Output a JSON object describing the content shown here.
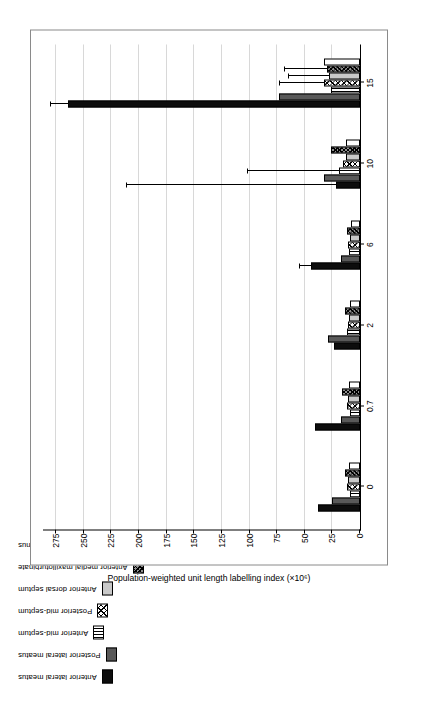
{
  "figure": {
    "corner_mark": "",
    "legend": {
      "items": [
        {
          "label": "Anterior lateral meatus",
          "pattern": "solid-black",
          "name": "legend-anterior-lateral-meatus"
        },
        {
          "label": "Posterior lateral meatus",
          "pattern": "solid-dgray",
          "name": "legend-posterior-lateral-meatus"
        },
        {
          "label": "Anterior mid-septum",
          "pattern": "vstripe",
          "name": "legend-anterior-mid-septum"
        },
        {
          "label": "Posterior mid-septum",
          "pattern": "xhatch",
          "name": "legend-posterior-mid-septum"
        },
        {
          "label": "Anterior dorsal septum",
          "pattern": "lgray",
          "name": "legend-anterior-dorsal-septum"
        },
        {
          "label": "Anterior medial maxilloturbinate",
          "pattern": "xhatch-dark",
          "name": "legend-anterior-medial-maxilloturbinate"
        },
        {
          "label": "Maxillary sinus",
          "pattern": "white",
          "name": "legend-maxillary-sinus"
        }
      ]
    }
  },
  "chart_data": {
    "type": "bar",
    "title": "",
    "xlabel": "",
    "ylabel": "Population-weighted unit length labelling index (×10⁶)",
    "categories": [
      "0",
      "0.7",
      "2",
      "6",
      "10",
      "15"
    ],
    "xtick_labels": [
      "0",
      "0.7",
      "2",
      "6",
      "10",
      "15"
    ],
    "ytick_labels": [
      "0",
      "25",
      "50",
      "75",
      "100",
      "125",
      "150",
      "175",
      "200",
      "225",
      "250",
      "275"
    ],
    "ylim": [
      0,
      287
    ],
    "grid": "horizontal",
    "legend_position": "top",
    "series": [
      {
        "name": "Anterior lateral meatus",
        "pattern": "solid-black",
        "values": [
          38,
          41,
          24,
          44,
          22,
          264
        ],
        "errors": [
          0,
          0,
          0,
          12,
          191,
          18
        ]
      },
      {
        "name": "Posterior lateral meatus",
        "pattern": "solid-dgray",
        "values": [
          25,
          17,
          29,
          17,
          33,
          73
        ],
        "errors": [
          0,
          0,
          0,
          0,
          0,
          0
        ]
      },
      {
        "name": "Anterior mid-septum",
        "pattern": "vstripe",
        "values": [
          9,
          9,
          12,
          10,
          19,
          26
        ],
        "errors": [
          0,
          0,
          0,
          0,
          84,
          0
        ]
      },
      {
        "name": "Posterior mid-septum",
        "pattern": "xhatch",
        "values": [
          12,
          12,
          11,
          11,
          15,
          33
        ],
        "errors": [
          0,
          0,
          0,
          0,
          0,
          41
        ]
      },
      {
        "name": "Anterior dorsal septum",
        "pattern": "lgray",
        "values": [
          11,
          11,
          10,
          9,
          13,
          28
        ],
        "errors": [
          0,
          0,
          0,
          0,
          0,
          38
        ]
      },
      {
        "name": "Anterior medial maxilloturbinate",
        "pattern": "xhatch-dark",
        "values": [
          14,
          16,
          14,
          12,
          26,
          30
        ],
        "errors": [
          0,
          0,
          0,
          0,
          0,
          40
        ]
      },
      {
        "name": "Maxillary sinus",
        "pattern": "white",
        "values": [
          10,
          10,
          9,
          8,
          13,
          33
        ],
        "errors": [
          0,
          0,
          0,
          0,
          0,
          0
        ]
      }
    ]
  }
}
